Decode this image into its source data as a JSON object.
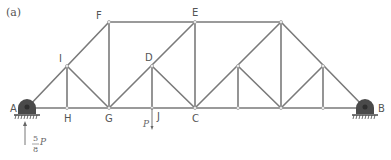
{
  "figure": {
    "panel_label": "(a)",
    "type": "truss",
    "colors": {
      "member": "#7a7a7a",
      "support": "#4a4a4a",
      "text": "#555555"
    }
  },
  "nodes": [
    {
      "id": "A",
      "label": "A",
      "x": 27,
      "y": 108
    },
    {
      "id": "H",
      "label": "H",
      "x": 67,
      "y": 108
    },
    {
      "id": "G",
      "label": "G",
      "x": 109,
      "y": 108
    },
    {
      "id": "J",
      "label": "J",
      "x": 152,
      "y": 108
    },
    {
      "id": "C",
      "label": "C",
      "x": 195,
      "y": 108
    },
    {
      "id": "K",
      "label": "",
      "x": 238,
      "y": 108
    },
    {
      "id": "L",
      "label": "",
      "x": 281,
      "y": 108
    },
    {
      "id": "M",
      "label": "",
      "x": 323,
      "y": 108
    },
    {
      "id": "B",
      "label": "B",
      "x": 365,
      "y": 108
    },
    {
      "id": "I",
      "label": "I",
      "x": 67,
      "y": 66
    },
    {
      "id": "D",
      "label": "D",
      "x": 152,
      "y": 66
    },
    {
      "id": "N",
      "label": "",
      "x": 238,
      "y": 66
    },
    {
      "id": "O",
      "label": "",
      "x": 323,
      "y": 66
    },
    {
      "id": "F",
      "label": "F",
      "x": 109,
      "y": 22
    },
    {
      "id": "E",
      "label": "E",
      "x": 195,
      "y": 22
    },
    {
      "id": "Q",
      "label": "",
      "x": 281,
      "y": 22
    }
  ],
  "labels": {
    "A": "A",
    "B": "B",
    "C": "C",
    "D": "D",
    "E": "E",
    "F": "F",
    "G": "G",
    "H": "H",
    "I": "I",
    "J": "J"
  },
  "loads": {
    "applied": {
      "symbol": "P",
      "at": "J",
      "direction": "down"
    },
    "reaction_A": {
      "numerator": "5",
      "denominator": "8",
      "symbol": "P",
      "direction": "up"
    }
  },
  "supports": [
    {
      "at": "A",
      "type": "pin"
    },
    {
      "at": "B",
      "type": "pin"
    }
  ]
}
